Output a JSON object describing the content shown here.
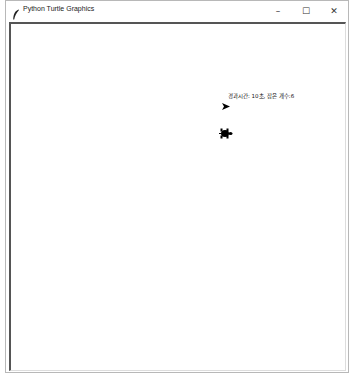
{
  "window": {
    "title": "Python Turtle Graphics",
    "app_icon": "feather-icon",
    "controls": {
      "minimize": "–",
      "maximize": "☐",
      "close": "✕"
    }
  },
  "canvas": {
    "background": "#ffffff",
    "status_text": "경과시간: 10초, 잡은 개수:6",
    "writer_turtle": {
      "shape": "arrow",
      "color": "#000000",
      "heading": "east"
    },
    "player_turtle": {
      "shape": "turtle",
      "color": "#000000",
      "heading": "east"
    }
  }
}
